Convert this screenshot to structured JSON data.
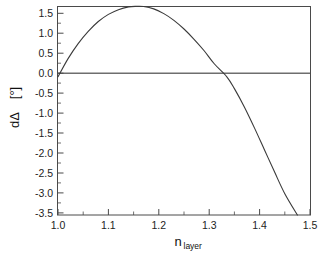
{
  "chart_data": {
    "type": "line",
    "title": "",
    "xlabel": "n",
    "xlabel_sub": "layer",
    "ylabel": "dΔ",
    "ylabel_units": "[°]",
    "xlim": [
      1.0,
      1.5
    ],
    "ylim": [
      -3.5,
      1.78
    ],
    "grid": false,
    "legend": null,
    "x_ticks": [
      "1.0",
      "1.1",
      "1.2",
      "1.3",
      "1.4",
      "1.5"
    ],
    "x_tick_values": [
      1.0,
      1.1,
      1.2,
      1.3,
      1.4,
      1.5
    ],
    "x_minor_count": 1,
    "y_ticks": [
      "1.5",
      "1.0",
      "0.5",
      "0.0",
      "-0.5",
      "-1.0",
      "-1.5",
      "-2.0",
      "-2.5",
      "-3.0",
      "-3.5"
    ],
    "y_tick_values": [
      1.5,
      1.0,
      0.5,
      0.0,
      -0.5,
      -1.0,
      -1.5,
      -2.0,
      -2.5,
      -3.0,
      -3.5
    ],
    "y_minor_count": 1,
    "reference_line_y": 0.0,
    "series": [
      {
        "name": "dΔ",
        "x": [
          1.0,
          1.02,
          1.04,
          1.06,
          1.08,
          1.1,
          1.12,
          1.14,
          1.155,
          1.17,
          1.19,
          1.21,
          1.23,
          1.25,
          1.27,
          1.29,
          1.31,
          1.335,
          1.35,
          1.37,
          1.39,
          1.41,
          1.43,
          1.45,
          1.475
        ],
        "y": [
          0.0,
          0.46,
          0.84,
          1.15,
          1.4,
          1.58,
          1.7,
          1.77,
          1.785,
          1.78,
          1.72,
          1.6,
          1.43,
          1.21,
          0.95,
          0.66,
          0.33,
          0.0,
          -0.3,
          -0.77,
          -1.3,
          -1.86,
          -2.42,
          -2.96,
          -3.5
        ],
        "color": "#3a3a3a"
      }
    ],
    "colors": {
      "background": "#ffffff",
      "axis": "#4a4a4a",
      "curve": "#3a3a3a",
      "reference_line": "#6e6e6e",
      "text": "#1d1d1d"
    }
  }
}
